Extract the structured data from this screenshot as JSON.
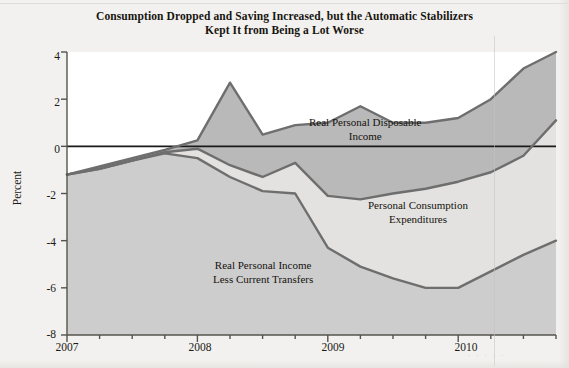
{
  "chart_data": {
    "type": "line",
    "title": "Consumption Dropped and Saving Increased, but the Automatic Stabilizers Kept It from Being a Lot Worse",
    "title_line1": "Consumption Dropped and Saving Increased, but the Automatic Stabilizers",
    "title_line2": "Kept It from Being a Lot Worse",
    "xlabel": "",
    "ylabel": "Percent",
    "ylim": [
      -8,
      4
    ],
    "xlim": [
      2007.0,
      2010.75
    ],
    "yticks": [
      4,
      2,
      0,
      -2,
      -4,
      -6,
      -8
    ],
    "ytick_labels": [
      "4",
      "2",
      "0",
      "-2",
      "-4",
      "-6",
      "-8"
    ],
    "xticks": [
      2007,
      2008,
      2009,
      2010
    ],
    "xtick_labels": [
      "2007",
      "2008",
      "2009",
      "2010"
    ],
    "xminor_step_quarters": 1,
    "grid": false,
    "legend_position": "inline-annotations",
    "zero_line": true,
    "shaded_between_series": true,
    "x": [
      2007.0,
      2007.25,
      2007.5,
      2007.75,
      2008.0,
      2008.25,
      2008.5,
      2008.75,
      2009.0,
      2009.25,
      2009.5,
      2009.75,
      2010.0,
      2010.25,
      2010.5,
      2010.75
    ],
    "x_quarter_labels": [
      "2007Q1",
      "2007Q2",
      "2007Q3",
      "2007Q4",
      "2008Q1",
      "2008Q2",
      "2008Q3",
      "2008Q4",
      "2009Q1",
      "2009Q2",
      "2009Q3",
      "2009Q4",
      "2010Q1",
      "2010Q2",
      "2010Q3",
      "2010Q4"
    ],
    "series": [
      {
        "name": "Real Personal Disposable Income",
        "label_line1": "Real Personal Disposable",
        "label_line2": "Income",
        "color": "#6e6e6e",
        "values": [
          -1.2,
          -0.85,
          -0.5,
          -0.15,
          0.25,
          2.7,
          0.5,
          0.9,
          1.0,
          1.7,
          1.0,
          1.0,
          1.2,
          2.0,
          3.3,
          4.0
        ]
      },
      {
        "name": "Personal Consumption Expenditures",
        "label_line1": "Personal Consumption",
        "label_line2": "Expenditures",
        "color": "#6e6e6e",
        "values": [
          -1.2,
          -0.95,
          -0.6,
          -0.25,
          -0.1,
          -0.8,
          -1.3,
          -0.7,
          -2.1,
          -2.25,
          -2.0,
          -1.8,
          -1.5,
          -1.1,
          -0.4,
          1.1
        ]
      },
      {
        "name": "Real Personal Income Less Current Transfers",
        "label_line1": "Real Personal Income",
        "label_line2": "Less Current Transfers",
        "color": "#6e6e6e",
        "values": [
          -1.2,
          -0.95,
          -0.6,
          -0.3,
          -0.5,
          -1.3,
          -1.9,
          -2.0,
          -4.3,
          -5.1,
          -5.6,
          -6.0,
          -6.0,
          -5.3,
          -4.6,
          -4.0
        ]
      }
    ],
    "colors": {
      "line": "#6e6e6e",
      "zero_line": "#1a1a1a",
      "axis": "#55534e",
      "fill_upper": "#b9b9b9",
      "fill_lower": "#cdcdcd",
      "fill_between": "#e3e2e0",
      "page_background": "#f2f1ef",
      "plot_background": "#ffffff",
      "text": "#17150f"
    }
  },
  "footer": {
    "artifact_text": "·  ·  ·  ·  ·"
  }
}
